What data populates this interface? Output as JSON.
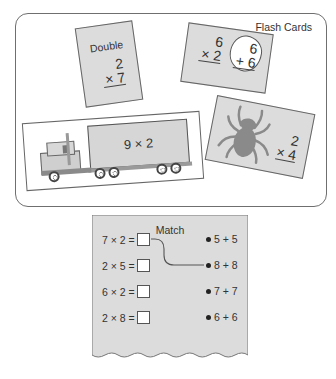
{
  "flash_cards": {
    "title": "Flash Cards",
    "card_double": {
      "label": "Double",
      "top": "2",
      "bottom": "× 7"
    },
    "card_add": {
      "top": "6",
      "bottom": "× 2",
      "hint_top": "6",
      "hint_bottom": "+ 6"
    },
    "card_truck": {
      "text": "9 × 2"
    },
    "card_spider": {
      "top": "2",
      "bottom": "× 4"
    }
  },
  "match": {
    "title": "Match",
    "problems": [
      "7 × 2 =",
      "2 × 5 =",
      "6 × 2 =",
      "2 × 8 ="
    ],
    "options": [
      "5 + 5",
      "8 + 8",
      "7 + 7",
      "6 + 6"
    ],
    "connection": {
      "from_problem": 0,
      "to_option": 2
    }
  },
  "colors": {
    "card_fill": "#dcdcdc",
    "border": "#666666",
    "text": "#333333"
  }
}
